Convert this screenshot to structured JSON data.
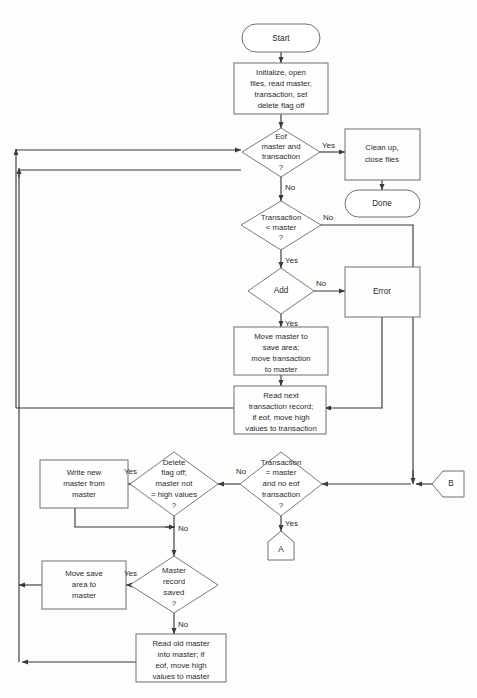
{
  "diagram": {
    "caption": "",
    "colors": {
      "background": "#fdfdfc",
      "shape_fill": "#ffffff",
      "shape_stroke": "#6e6e6e",
      "line": "#3a3a3a",
      "text": "#2b2b2b"
    },
    "nodes": [
      {
        "id": "start",
        "type": "terminator",
        "label": "Start"
      },
      {
        "id": "init",
        "type": "process",
        "label": "Initialize, open\nfiles, read master,\ntransaction, set\ndelete flag off"
      },
      {
        "id": "eof",
        "type": "decision",
        "label": "Eof\nmaster and\ntransaction\n?"
      },
      {
        "id": "cleanup",
        "type": "process",
        "label": "Clean up,\nclose files"
      },
      {
        "id": "done",
        "type": "terminator",
        "label": "Done"
      },
      {
        "id": "translt",
        "type": "decision",
        "label": "Transaction\n< master\n?"
      },
      {
        "id": "add",
        "type": "decision",
        "label": "Add"
      },
      {
        "id": "error",
        "type": "process",
        "label": "Error"
      },
      {
        "id": "movemaster",
        "type": "process",
        "label": "Move master to\nsave area;\nmove transaction\nto master"
      },
      {
        "id": "readnext",
        "type": "process",
        "label": "Read next\ntransaction record;\nif eof, move  high\nvalues to transaction"
      },
      {
        "id": "writenew",
        "type": "process",
        "label": "Write new\nmaster from\nmaster"
      },
      {
        "id": "deleteflag",
        "type": "decision",
        "label": "Delete\nflag off;\nmaster not\n= high values\n?"
      },
      {
        "id": "transeq",
        "type": "decision",
        "label": "Transaction\n= master\nand no eof\ntransaction\n?"
      },
      {
        "id": "connb",
        "type": "connector",
        "label": "B"
      },
      {
        "id": "conna",
        "type": "connector",
        "label": "A"
      },
      {
        "id": "movesave",
        "type": "process",
        "label": "Move save\narea  to\nmaster"
      },
      {
        "id": "mastersaved",
        "type": "decision",
        "label": "Master\nrecord\nsaved\n?"
      },
      {
        "id": "readold",
        "type": "process",
        "label": "Read old master\ninto master; if\neof, move high\nvalues to master"
      }
    ],
    "edge_labels": {
      "eof_yes": "Yes",
      "eof_no": "No",
      "translt_no": "No",
      "translt_yes": "Yes",
      "add_no": "No",
      "add_yes": "Yes",
      "deleteflag_yes": "Yes",
      "deleteflag_no": "No",
      "transeq_no": "No",
      "transeq_yes": "Yes",
      "mastersaved_yes": "Yes",
      "mastersaved_no": "No"
    },
    "node_text": {
      "start": "Start",
      "init_l1": "Initialize, open",
      "init_l2": "files, read master,",
      "init_l3": "transaction, set",
      "init_l4": "delete flag off",
      "eof_l1": "Eof",
      "eof_l2": "master and",
      "eof_l3": "transaction",
      "eof_l4": "?",
      "cleanup_l1": "Clean up,",
      "cleanup_l2": "close files",
      "done": "Done",
      "translt_l1": "Transaction",
      "translt_l2": "< master",
      "translt_l3": "?",
      "add_l1": "Add",
      "error": "Error",
      "movemaster_l1": "Move master to",
      "movemaster_l2": "save area;",
      "movemaster_l3": "move transaction",
      "movemaster_l4": "to master",
      "readnext_l1": "Read next",
      "readnext_l2": "transaction record;",
      "readnext_l3": "if eof, move  high",
      "readnext_l4": "values to transaction",
      "writenew_l1": "Write new",
      "writenew_l2": "master from",
      "writenew_l3": "master",
      "deleteflag_l1": "Delete",
      "deleteflag_l2": "flag off;",
      "deleteflag_l3": "master not",
      "deleteflag_l4": "= high values",
      "deleteflag_l5": "?",
      "transeq_l1": "Transaction",
      "transeq_l2": "= master",
      "transeq_l3": "and no eof",
      "transeq_l4": "transaction",
      "transeq_l5": "?",
      "connb": "B",
      "conna": "A",
      "movesave_l1": "Move save",
      "movesave_l2": "area  to",
      "movesave_l3": "master",
      "mastersaved_l1": "Master",
      "mastersaved_l2": "record",
      "mastersaved_l3": "saved",
      "mastersaved_l4": "?",
      "readold_l1": "Read old master",
      "readold_l2": "into master; if",
      "readold_l3": "eof, move high",
      "readold_l4": "values to master"
    }
  }
}
